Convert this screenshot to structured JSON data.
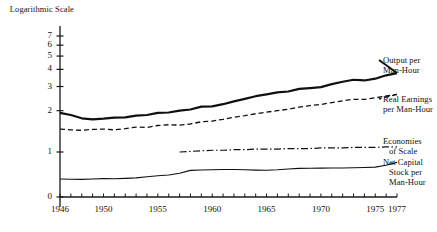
{
  "chart_data": {
    "type": "line",
    "title": "",
    "ylabel": "Logarithmic Scale",
    "xlabel": "",
    "yscale": "log",
    "ylim": [
      0,
      7.6
    ],
    "xlim": [
      1946,
      1977
    ],
    "ytick_labels": [
      "0",
      "1",
      "2",
      "3",
      "4",
      "5",
      "6",
      "7"
    ],
    "ytick_values": [
      0,
      1,
      2,
      3,
      4,
      5,
      6,
      7
    ],
    "xtick_labels": [
      "1946",
      "1950",
      "1955",
      "1960",
      "1965",
      "1970",
      "1975",
      "1977"
    ],
    "xtick_values": [
      1946,
      1950,
      1955,
      1960,
      1965,
      1970,
      1975,
      1977
    ],
    "minor_xticks_every": 1,
    "grid": false,
    "legend_position": "right-inline",
    "series": [
      {
        "name": "Output per Man-Hour",
        "style": "solid-thick",
        "x": [
          1946,
          1947,
          1948,
          1949,
          1950,
          1951,
          1952,
          1953,
          1954,
          1955,
          1956,
          1957,
          1958,
          1959,
          1960,
          1961,
          1962,
          1963,
          1964,
          1965,
          1966,
          1967,
          1968,
          1969,
          1970,
          1971,
          1972,
          1973,
          1974,
          1975,
          1976,
          1977
        ],
        "values": [
          1.93,
          1.86,
          1.76,
          1.73,
          1.75,
          1.78,
          1.79,
          1.84,
          1.86,
          1.93,
          1.94,
          2.0,
          2.04,
          2.14,
          2.15,
          2.23,
          2.34,
          2.44,
          2.55,
          2.63,
          2.72,
          2.76,
          2.88,
          2.92,
          2.97,
          3.12,
          3.25,
          3.36,
          3.32,
          3.42,
          3.62,
          3.76
        ]
      },
      {
        "name": "Real Earnings per Man-Hour",
        "style": "dashed",
        "x": [
          1946,
          1947,
          1948,
          1949,
          1950,
          1951,
          1952,
          1953,
          1954,
          1955,
          1956,
          1957,
          1958,
          1959,
          1960,
          1961,
          1962,
          1963,
          1964,
          1965,
          1966,
          1967,
          1968,
          1969,
          1970,
          1971,
          1972,
          1973,
          1974,
          1975,
          1976,
          1977
        ],
        "values": [
          1.47,
          1.45,
          1.44,
          1.46,
          1.47,
          1.45,
          1.48,
          1.52,
          1.51,
          1.56,
          1.58,
          1.57,
          1.6,
          1.66,
          1.68,
          1.73,
          1.79,
          1.84,
          1.9,
          1.95,
          2.0,
          2.05,
          2.12,
          2.18,
          2.22,
          2.29,
          2.36,
          2.42,
          2.42,
          2.48,
          2.56,
          2.63
        ]
      },
      {
        "name": "Economies of Scale",
        "style": "dash-dot",
        "x": [
          1957,
          1958,
          1959,
          1960,
          1961,
          1962,
          1963,
          1964,
          1965,
          1966,
          1967,
          1968,
          1969,
          1970,
          1971,
          1972,
          1973,
          1974,
          1975,
          1976,
          1977
        ],
        "values": [
          1.0,
          1.01,
          1.02,
          1.03,
          1.03,
          1.04,
          1.04,
          1.05,
          1.05,
          1.05,
          1.06,
          1.06,
          1.06,
          1.07,
          1.07,
          1.07,
          1.08,
          1.08,
          1.08,
          1.09,
          1.09
        ]
      },
      {
        "name": "Net Capital Stock per Man-Hour",
        "style": "solid-thin",
        "x": [
          1946,
          1947,
          1948,
          1949,
          1950,
          1951,
          1952,
          1953,
          1954,
          1955,
          1956,
          1957,
          1958,
          1959,
          1960,
          1961,
          1962,
          1963,
          1964,
          1965,
          1966,
          1967,
          1968,
          1969,
          1970,
          1971,
          1972,
          1973,
          1974,
          1975,
          1976,
          1977
        ],
        "values": [
          0.635,
          0.633,
          0.632,
          0.636,
          0.64,
          0.638,
          0.642,
          0.648,
          0.66,
          0.672,
          0.68,
          0.7,
          0.735,
          0.74,
          0.742,
          0.745,
          0.746,
          0.742,
          0.738,
          0.736,
          0.742,
          0.752,
          0.76,
          0.762,
          0.763,
          0.764,
          0.765,
          0.768,
          0.772,
          0.776,
          0.8,
          0.84
        ]
      }
    ],
    "annotations": [
      {
        "name": "Output per Man-Hour",
        "lines": [
          "Output per",
          "Man-Hour"
        ]
      },
      {
        "name": "Real Earnings per Man-Hour",
        "lines": [
          "Real Earnings",
          "per Man-Hour"
        ]
      },
      {
        "name": "Economies of Scale",
        "lines": [
          "Economies",
          "of Scale"
        ]
      },
      {
        "name": "Net Capital Stock per Man-Hour",
        "lines": [
          "Net Capital",
          "Stock per",
          "Man-Hour"
        ]
      }
    ]
  }
}
